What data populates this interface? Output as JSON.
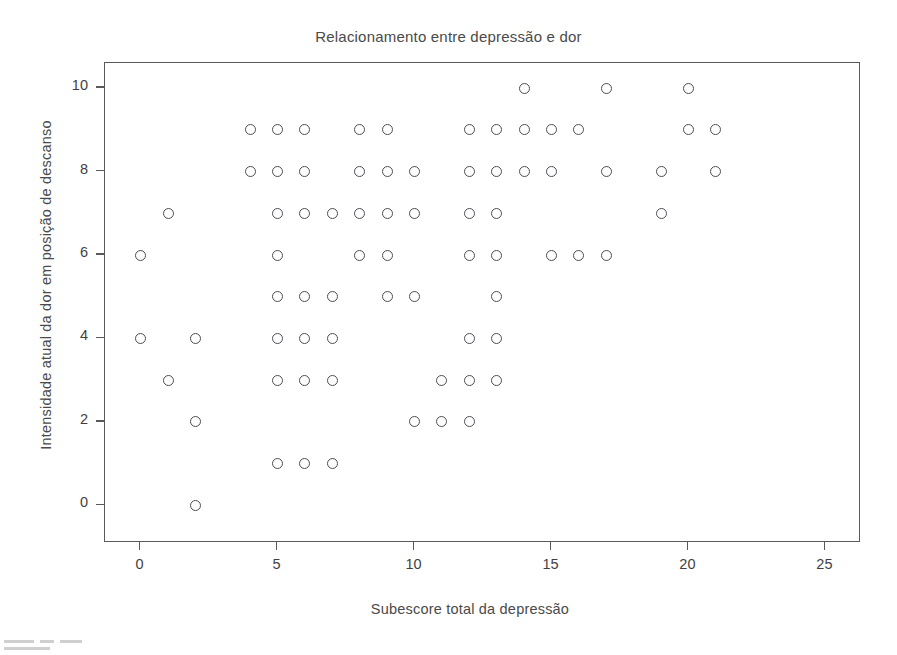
{
  "chart_data": {
    "type": "scatter",
    "title": "Relacionamento entre depressão e dor",
    "xlabel": "Subescore total da depressão",
    "ylabel": "Intensidade atual da dor em posição de descanso",
    "xlim": [
      -1.3,
      26.3
    ],
    "ylim": [
      -0.9,
      10.6
    ],
    "xticks": [
      0,
      5,
      10,
      15,
      20,
      25
    ],
    "yticks": [
      0,
      2,
      4,
      6,
      8,
      10
    ],
    "xtick_labels": [
      "0",
      "5",
      "10",
      "15",
      "20",
      "25"
    ],
    "ytick_labels": [
      "0",
      "2",
      "4",
      "6",
      "8",
      "10"
    ],
    "grid": false,
    "legend": null,
    "marker": "open-circle",
    "marker_color": "#4d4d55",
    "points": [
      {
        "x": 0,
        "y": 6
      },
      {
        "x": 0,
        "y": 4
      },
      {
        "x": 1,
        "y": 7
      },
      {
        "x": 1,
        "y": 3
      },
      {
        "x": 2,
        "y": 4
      },
      {
        "x": 2,
        "y": 2
      },
      {
        "x": 2,
        "y": 0
      },
      {
        "x": 4,
        "y": 9
      },
      {
        "x": 4,
        "y": 8
      },
      {
        "x": 5,
        "y": 9
      },
      {
        "x": 5,
        "y": 8
      },
      {
        "x": 5,
        "y": 7
      },
      {
        "x": 5,
        "y": 6
      },
      {
        "x": 5,
        "y": 5
      },
      {
        "x": 5,
        "y": 4
      },
      {
        "x": 5,
        "y": 3
      },
      {
        "x": 5,
        "y": 1
      },
      {
        "x": 6,
        "y": 9
      },
      {
        "x": 6,
        "y": 8
      },
      {
        "x": 6,
        "y": 7
      },
      {
        "x": 6,
        "y": 5
      },
      {
        "x": 6,
        "y": 4
      },
      {
        "x": 6,
        "y": 3
      },
      {
        "x": 6,
        "y": 1
      },
      {
        "x": 7,
        "y": 7
      },
      {
        "x": 7,
        "y": 5
      },
      {
        "x": 7,
        "y": 4
      },
      {
        "x": 7,
        "y": 3
      },
      {
        "x": 7,
        "y": 1
      },
      {
        "x": 8,
        "y": 9
      },
      {
        "x": 8,
        "y": 8
      },
      {
        "x": 8,
        "y": 7
      },
      {
        "x": 8,
        "y": 6
      },
      {
        "x": 9,
        "y": 9
      },
      {
        "x": 9,
        "y": 8
      },
      {
        "x": 9,
        "y": 7
      },
      {
        "x": 9,
        "y": 6
      },
      {
        "x": 9,
        "y": 5
      },
      {
        "x": 10,
        "y": 8
      },
      {
        "x": 10,
        "y": 7
      },
      {
        "x": 10,
        "y": 5
      },
      {
        "x": 10,
        "y": 2
      },
      {
        "x": 11,
        "y": 3
      },
      {
        "x": 11,
        "y": 2
      },
      {
        "x": 12,
        "y": 9
      },
      {
        "x": 12,
        "y": 8
      },
      {
        "x": 12,
        "y": 7
      },
      {
        "x": 12,
        "y": 6
      },
      {
        "x": 12,
        "y": 4
      },
      {
        "x": 12,
        "y": 3
      },
      {
        "x": 12,
        "y": 2
      },
      {
        "x": 13,
        "y": 9
      },
      {
        "x": 13,
        "y": 8
      },
      {
        "x": 13,
        "y": 7
      },
      {
        "x": 13,
        "y": 6
      },
      {
        "x": 13,
        "y": 5
      },
      {
        "x": 13,
        "y": 4
      },
      {
        "x": 13,
        "y": 3
      },
      {
        "x": 14,
        "y": 10
      },
      {
        "x": 14,
        "y": 9
      },
      {
        "x": 14,
        "y": 8
      },
      {
        "x": 15,
        "y": 9
      },
      {
        "x": 15,
        "y": 8
      },
      {
        "x": 15,
        "y": 6
      },
      {
        "x": 16,
        "y": 9
      },
      {
        "x": 16,
        "y": 6
      },
      {
        "x": 17,
        "y": 10
      },
      {
        "x": 17,
        "y": 8
      },
      {
        "x": 17,
        "y": 6
      },
      {
        "x": 19,
        "y": 8
      },
      {
        "x": 19,
        "y": 7
      },
      {
        "x": 20,
        "y": 10
      },
      {
        "x": 20,
        "y": 9
      },
      {
        "x": 21,
        "y": 9
      },
      {
        "x": 21,
        "y": 8
      }
    ]
  }
}
